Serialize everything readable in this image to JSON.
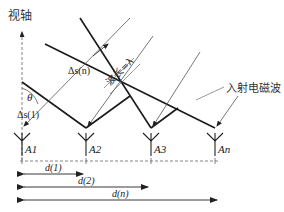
{
  "diagram": {
    "axis_label": "视轴",
    "wave_label": "入射电磁波",
    "wavelength_label": "波长=λ",
    "angle_label": "θ",
    "path_diffs": [
      {
        "id": "ds1",
        "label": "Δs(1)"
      },
      {
        "id": "dsn",
        "label": "Δs(n)"
      }
    ],
    "antennas": [
      {
        "id": "A1",
        "label": "A1"
      },
      {
        "id": "A2",
        "label": "A2"
      },
      {
        "id": "A3",
        "label": "A3"
      },
      {
        "id": "An",
        "label": "An"
      }
    ],
    "distances": [
      {
        "id": "d1",
        "label": "d(1)"
      },
      {
        "id": "d2",
        "label": "d(2)"
      },
      {
        "id": "dn",
        "label": "d(n)"
      }
    ],
    "colors": {
      "wavefront": "#1a1a1a",
      "ray": "#555555",
      "dashed": "#666666"
    }
  }
}
